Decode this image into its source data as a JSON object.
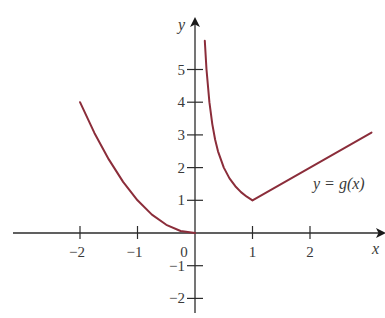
{
  "chart_data": {
    "type": "line",
    "title": "",
    "xlabel": "x",
    "ylabel": "y",
    "xlim": [
      -3.2,
      3.3
    ],
    "ylim": [
      -2.4,
      6.6
    ],
    "x_ticks": [
      -2,
      -1,
      0,
      1,
      2
    ],
    "x_tick_labels": [
      "−2",
      "−1",
      "0",
      "1",
      "2"
    ],
    "y_ticks": [
      -2,
      -1,
      1,
      2,
      3,
      4,
      5
    ],
    "y_tick_labels": [
      "−2",
      "−1",
      "1",
      "2",
      "3",
      "4",
      "5"
    ],
    "grid": false,
    "function_label": "y = g(x)",
    "line_color": "#8b2d3a",
    "series": [
      {
        "name": "left-branch",
        "description": "parabola y = x^2",
        "x": [
          -2,
          -1.75,
          -1.5,
          -1.25,
          -1,
          -0.75,
          -0.5,
          -0.25,
          0
        ],
        "y": [
          4,
          3.0625,
          2.25,
          1.5625,
          1,
          0.5625,
          0.25,
          0.0625,
          0
        ]
      },
      {
        "name": "middle-branch",
        "description": "hyperbola y = 1/x",
        "x": [
          0.17,
          0.2,
          0.25,
          0.3,
          0.35,
          0.4,
          0.5,
          0.6,
          0.7,
          0.8,
          0.9,
          1
        ],
        "y": [
          5.88,
          5,
          4,
          3.33,
          2.86,
          2.5,
          2,
          1.67,
          1.43,
          1.25,
          1.11,
          1
        ]
      },
      {
        "name": "right-branch",
        "description": "line y = x",
        "x": [
          1,
          3.07
        ],
        "y": [
          1,
          3.07
        ]
      }
    ]
  }
}
